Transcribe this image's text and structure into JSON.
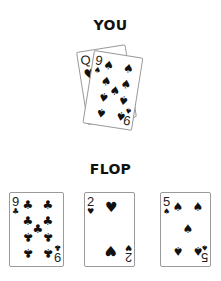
{
  "labels": {
    "you": "YOU",
    "flop": "FLOP"
  },
  "suits": {
    "spade": "♠",
    "heart": "♥",
    "club": "♣",
    "diamond": "♦"
  },
  "hand": [
    {
      "rank": "Q",
      "suit": "heart",
      "suit_glyph": "♥",
      "icon": "heart-icon"
    },
    {
      "rank": "9",
      "suit": "spade",
      "suit_glyph": "♠",
      "icon": "spade-icon"
    }
  ],
  "flop": [
    {
      "rank": "9",
      "suit": "club",
      "suit_glyph": "♣",
      "icon": "club-icon"
    },
    {
      "rank": "2",
      "suit": "heart",
      "suit_glyph": "♥",
      "icon": "heart-icon"
    },
    {
      "rank": "5",
      "suit": "spade",
      "suit_glyph": "♠",
      "icon": "spade-icon"
    }
  ]
}
